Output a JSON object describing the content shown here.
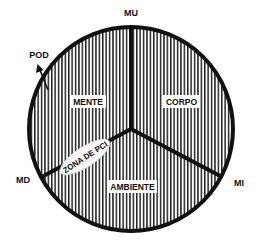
{
  "diagram": {
    "labels": {
      "top": "MU",
      "left": "MD",
      "right": "MI",
      "arrow": "POD"
    },
    "sectors": [
      {
        "id": "mente",
        "label": "MENTE"
      },
      {
        "id": "corpo",
        "label": "CORPO"
      },
      {
        "id": "ambiente",
        "label": "AMBIENTE"
      }
    ],
    "zone": {
      "label": "ZONA DE PCI"
    },
    "colors": {
      "line": "#111111",
      "hatch": "#222222",
      "background": "#ffffff"
    }
  }
}
